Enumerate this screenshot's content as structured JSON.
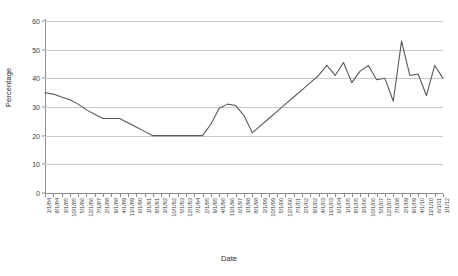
{
  "chart_data": {
    "type": "line",
    "title": "",
    "xlabel": "Date",
    "ylabel": "Percentage",
    "ylim": [
      0,
      60
    ],
    "y_ticks": [
      0,
      10,
      20,
      30,
      40,
      50,
      60
    ],
    "grid": true,
    "legend": "none",
    "series_name": "Percentage",
    "line_color": "#595959",
    "categories": [
      "1/1/84",
      "8/1/84",
      "3/1/85",
      "10/1/85",
      "5/1/86",
      "12/1/86",
      "7/1/87",
      "2/1/88",
      "9/1/88",
      "4/1/89",
      "11/1/89",
      "6/1/90",
      "1/1/91",
      "8/1/91",
      "3/1/92",
      "10/1/92",
      "5/1/93",
      "12/1/93",
      "7/1/94",
      "2/1/95",
      "9/1/95",
      "4/1/96",
      "11/1/96",
      "6/1/97",
      "1/1/98",
      "8/1/98",
      "3/1/99",
      "10/1/99",
      "5/1/00",
      "12/1/00",
      "7/1/01",
      "2/1/02",
      "9/1/02",
      "4/1/03",
      "11/1/03",
      "6/1/04",
      "1/1/05",
      "8/1/05",
      "3/1/06",
      "10/1/06",
      "5/1/07",
      "12/1/07",
      "7/1/08",
      "2/1/09",
      "9/1/09",
      "4/1/10",
      "11/1/10",
      "6/1/11",
      "1/1/12"
    ],
    "values": [
      35,
      34.5,
      33.5,
      32.5,
      31,
      29,
      27.5,
      26,
      26,
      26,
      24.5,
      23,
      21.5,
      20,
      20,
      20,
      20,
      20,
      20,
      20,
      24,
      29.5,
      31,
      30.5,
      27,
      21,
      23.5,
      26,
      28.5,
      31,
      33.5,
      36,
      38.5,
      41,
      44.5,
      41,
      45.5,
      38.5,
      42.5,
      44.5,
      39.5,
      40,
      32,
      53,
      41,
      41.5,
      34,
      44.5,
      40
    ]
  }
}
